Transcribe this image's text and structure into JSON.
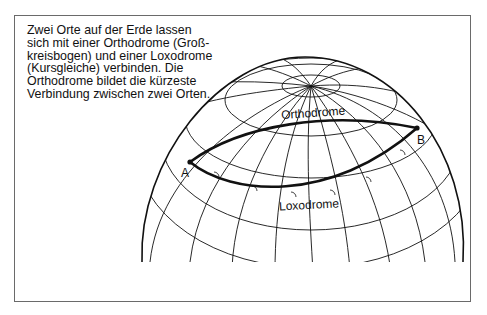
{
  "caption": {
    "lines": [
      "Zwei Orte auf der Erde lassen",
      "sich mit einer Orthodrome (Groß-",
      "kreisbogen) und einer Loxodrome",
      "(Kursgleiche) verbinden. Die",
      "Orthodrome bildet die kürzeste",
      "Verbindung zwischen zwei Orten."
    ]
  },
  "diagram": {
    "labels": {
      "orthodrome": "Orthodrome",
      "loxodrome": "Loxodrome",
      "point_a": "A",
      "point_b": "B"
    },
    "colors": {
      "line": "#111111",
      "frame": "#6a6a6a",
      "background": "#ffffff"
    }
  }
}
